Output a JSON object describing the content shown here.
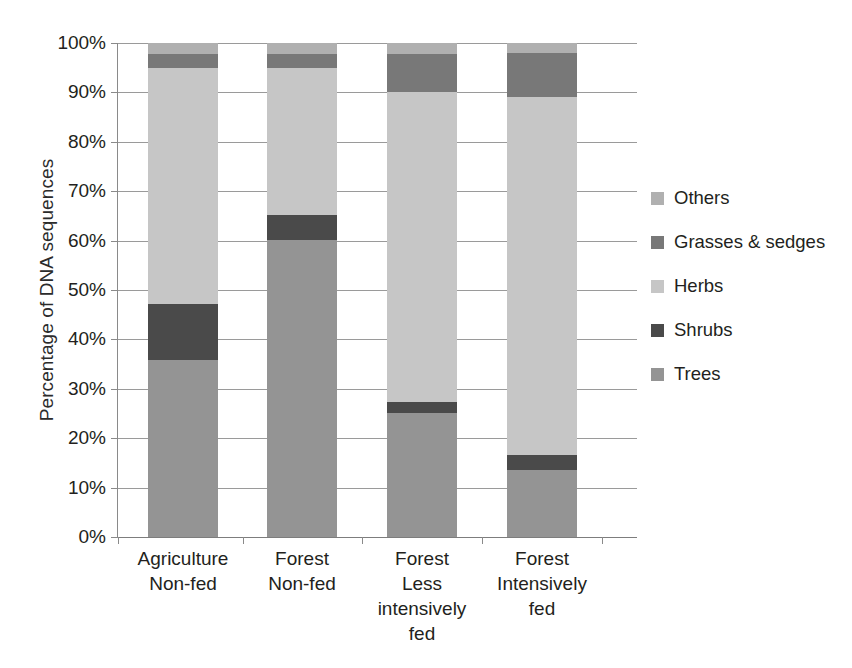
{
  "chart_data": {
    "type": "bar",
    "subtype": "stacked-percentage",
    "title": "",
    "xlabel": "",
    "ylabel": "Percentage of DNA sequences",
    "ylim": [
      0,
      100
    ],
    "yticks": [
      "0%",
      "10%",
      "20%",
      "30%",
      "40%",
      "50%",
      "60%",
      "70%",
      "80%",
      "90%",
      "100%"
    ],
    "grid": true,
    "legend_position": "right",
    "categories": [
      "Agriculture\nNon-fed",
      "Forest\nNon-fed",
      "Forest\nLess\nintensively\nfed",
      "Forest\nIntensively\nfed"
    ],
    "category_lines": [
      [
        "Agriculture",
        "Non-fed"
      ],
      [
        "Forest",
        "Non-fed"
      ],
      [
        "Forest",
        "Less",
        "intensively",
        "fed"
      ],
      [
        "Forest",
        "Intensively",
        "fed"
      ]
    ],
    "series": [
      {
        "name": "Trees",
        "color": "#949494",
        "values": [
          35.8,
          60.1,
          25.1,
          13.6
        ]
      },
      {
        "name": "Shrubs",
        "color": "#4a4a4a",
        "values": [
          11.4,
          5.1,
          2.2,
          3.0
        ]
      },
      {
        "name": "Herbs",
        "color": "#c6c6c6",
        "values": [
          47.8,
          29.8,
          62.7,
          72.4
        ]
      },
      {
        "name": "Grasses & sedges",
        "color": "#787878",
        "values": [
          2.8,
          2.8,
          7.8,
          9.0
        ]
      },
      {
        "name": "Others",
        "color": "#b0b0b0",
        "values": [
          2.2,
          2.2,
          2.2,
          2.0
        ]
      }
    ],
    "legend_order": [
      "Others",
      "Grasses & sedges",
      "Herbs",
      "Shrubs",
      "Trees"
    ]
  },
  "legend": {
    "items": [
      {
        "label": "Others",
        "color": "#b0b0b0"
      },
      {
        "label": "Grasses & sedges",
        "color": "#787878"
      },
      {
        "label": "Herbs",
        "color": "#c6c6c6"
      },
      {
        "label": "Shrubs",
        "color": "#4a4a4a"
      },
      {
        "label": "Trees",
        "color": "#949494"
      }
    ]
  }
}
